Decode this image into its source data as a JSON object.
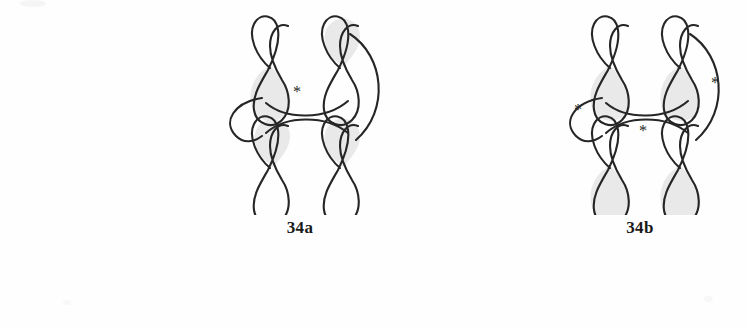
{
  "page": {
    "background_color": "#fefefe",
    "stroke_color": "#262626",
    "shade_color": "#e6e6e6"
  },
  "figures": [
    {
      "id": "34a",
      "label": "34a",
      "asterisk_count": 1,
      "asterisks": [
        {
          "name": "asterisk-center",
          "x": 97,
          "y": 92,
          "symbol": "*"
        }
      ],
      "knots": [
        {
          "name": "figure-eight-upper-left",
          "x": 62,
          "y": 18,
          "shaded_lobe": "bottom"
        },
        {
          "name": "figure-eight-upper-right",
          "x": 132,
          "y": 18,
          "shaded_lobe": "top"
        },
        {
          "name": "figure-eight-lower-left",
          "x": 62,
          "y": 118,
          "shaded_lobe": "top"
        },
        {
          "name": "figure-eight-lower-right",
          "x": 132,
          "y": 118,
          "shaded_lobe": "top"
        }
      ],
      "arcs": [
        {
          "name": "arc-upper-connector",
          "description": "arc joining the two upper lobes"
        },
        {
          "name": "arc-lower-connector",
          "description": "arc joining the two lower lobes"
        },
        {
          "name": "arc-left-c-curve",
          "description": "left C shaped curve"
        },
        {
          "name": "arc-right-c-curve",
          "description": "large right C shaped curve"
        }
      ]
    },
    {
      "id": "34b",
      "label": "34b",
      "asterisk_count": 3,
      "asterisks": [
        {
          "name": "asterisk-left",
          "x": 38,
          "y": 110,
          "symbol": "*"
        },
        {
          "name": "asterisk-center",
          "x": 103,
          "y": 131,
          "symbol": "*"
        },
        {
          "name": "asterisk-right",
          "x": 175,
          "y": 83,
          "symbol": "*"
        }
      ],
      "knots": [
        {
          "name": "figure-eight-upper-left",
          "x": 62,
          "y": 18,
          "shaded_lobe": "bottom"
        },
        {
          "name": "figure-eight-upper-right",
          "x": 132,
          "y": 18,
          "shaded_lobe": "bottom"
        },
        {
          "name": "figure-eight-lower-left",
          "x": 62,
          "y": 118,
          "shaded_lobe": "bottom"
        },
        {
          "name": "figure-eight-lower-right",
          "x": 132,
          "y": 118,
          "shaded_lobe": "bottom"
        }
      ],
      "arcs": [
        {
          "name": "arc-upper-connector",
          "description": "arc joining the two upper lobes"
        },
        {
          "name": "arc-lower-connector",
          "description": "arc joining the two lower lobes"
        },
        {
          "name": "arc-left-c-curve",
          "description": "left C shaped curve"
        },
        {
          "name": "arc-right-c-curve",
          "description": "large right C shaped curve"
        }
      ]
    }
  ]
}
